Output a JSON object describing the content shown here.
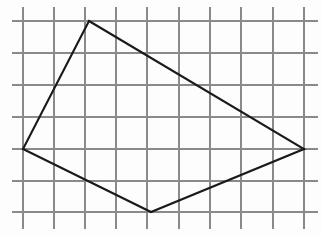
{
  "figure": {
    "background_color": "#fdfdfd",
    "width": 322,
    "height": 235
  },
  "grid": {
    "color": "#8a8a8a",
    "stroke_width": 1.5,
    "cell_size": 31,
    "vertical_line_count": 10,
    "horizontal_line_count": 7,
    "vertical_x": [
      23,
      54,
      85,
      116,
      147,
      179,
      210,
      241,
      273,
      304
    ],
    "horizontal_y": [
      21,
      53,
      85,
      117,
      149,
      181,
      212
    ],
    "vertical_extent": [
      7,
      229
    ],
    "horizontal_extent": [
      12,
      318
    ]
  },
  "shape": {
    "name": "quadrilateral",
    "sides": 4,
    "color": "#1a1a1a",
    "stroke_width": 2.1,
    "fill": "none",
    "vertices": [
      {
        "label": "top",
        "x": 89,
        "y": 21,
        "grid_col": 3,
        "grid_row": 1
      },
      {
        "label": "right",
        "x": 304,
        "y": 149,
        "grid_col": 10,
        "grid_row": 5
      },
      {
        "label": "bottom",
        "x": 151,
        "y": 212,
        "grid_col": 5,
        "grid_row": 7
      },
      {
        "label": "left",
        "x": 23,
        "y": 149,
        "grid_col": 1,
        "grid_row": 5
      }
    ],
    "points_attr": "89,21 304,149 151,212 23,149"
  }
}
